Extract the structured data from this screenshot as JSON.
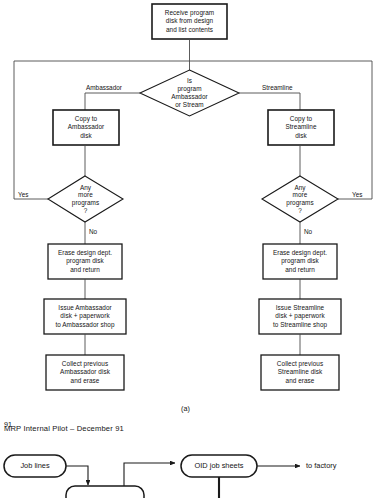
{
  "figure": {
    "caption": "(a)",
    "page_number": "91"
  },
  "flowchart": {
    "start": {
      "lines": [
        "Receive program",
        "disk from design",
        "and list contents"
      ]
    },
    "decision_main": {
      "lines": [
        "Is",
        "program",
        "Ambassador",
        "or Stream"
      ]
    },
    "branch_labels": {
      "left": "Ambassador",
      "right": "Streamline"
    },
    "left_branch": {
      "copy": {
        "lines": [
          "Copy to",
          "Ambassador",
          "disk"
        ]
      },
      "loop_decision": {
        "lines": [
          "Any",
          "more",
          "programs",
          "?"
        ]
      },
      "loop_yes": "Yes",
      "loop_no": "No",
      "erase": {
        "lines": [
          "Erase design dept.",
          "program disk",
          "and return"
        ]
      },
      "issue": {
        "lines": [
          "Issue Ambassador",
          "disk + paperwork",
          "to Ambassador shop"
        ]
      },
      "collect": {
        "lines": [
          "Collect previous",
          "Ambassador disk",
          "and erase"
        ]
      }
    },
    "right_branch": {
      "copy": {
        "lines": [
          "Copy to",
          "Streamline",
          "disk"
        ]
      },
      "loop_decision": {
        "lines": [
          "Any",
          "more",
          "programs",
          "?"
        ]
      },
      "loop_yes": "Yes",
      "loop_no": "No",
      "erase": {
        "lines": [
          "Erase design dept.",
          "program disk",
          "and return"
        ]
      },
      "issue": {
        "lines": [
          "Issue Streamline",
          "disk + paperwork",
          "to Streamline shop"
        ]
      },
      "collect": {
        "lines": [
          "Collect previous",
          "Streamline disk",
          "and erase"
        ]
      }
    }
  },
  "lower_section": {
    "title": "MRP Internal Pilot – December 91",
    "nodes": {
      "job_lines": "Job lines",
      "oid_job_sheets": "OID job sheets",
      "to_factory": "to factory"
    }
  },
  "colors": {
    "stroke": "#1a1a1a",
    "thin_stroke": "#4a4a4a",
    "background": "#ffffff"
  }
}
